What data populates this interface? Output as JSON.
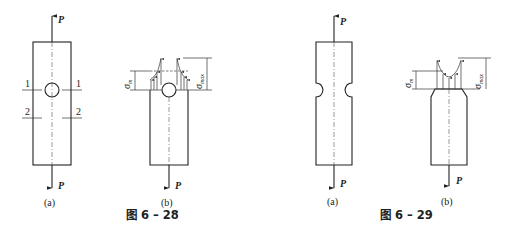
{
  "figures": [
    {
      "id": "fig-6-28",
      "caption": "图 6 – 28",
      "subfigures": [
        {
          "label": "(a)",
          "description": "Plate with central circular hole under axial tension P",
          "force_top": "P",
          "force_bottom": "P",
          "section_labels": [
            "1",
            "1",
            "2",
            "2"
          ]
        },
        {
          "label": "(b)",
          "description": "Stress distribution at section 1-1 near hole",
          "force_bottom": "P",
          "stress_labels": {
            "nominal": "σm",
            "max": "σmax"
          }
        }
      ]
    },
    {
      "id": "fig-6-29",
      "caption": "图 6 – 29",
      "subfigures": [
        {
          "label": "(a)",
          "description": "Bar with circumferential notch under axial tension P",
          "force_top": "P",
          "force_bottom": "P"
        },
        {
          "label": "(b)",
          "description": "Stress distribution at notched section",
          "force_bottom": "P",
          "stress_labels": {
            "nominal": "σm",
            "max": "σmax"
          }
        }
      ]
    }
  ],
  "text": {
    "P": "P",
    "sigma": "σ",
    "sub_m": "m",
    "sub_max": "max",
    "sec1": "1",
    "sec2": "2",
    "a": "(a)",
    "b": "(b)",
    "cap28": "图 6 – 28",
    "cap29": "图 6 – 29"
  }
}
